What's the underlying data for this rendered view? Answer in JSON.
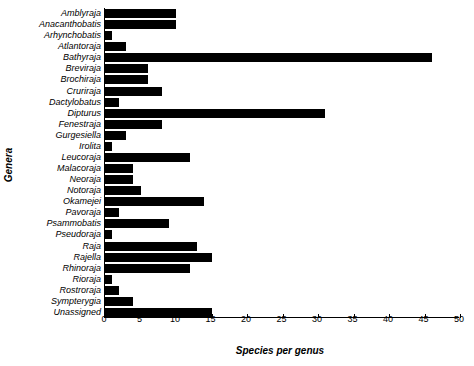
{
  "chart_data": {
    "type": "bar",
    "orientation": "horizontal",
    "title": "",
    "xlabel": "Species per genus",
    "ylabel": "Genera",
    "xlim": [
      0,
      50
    ],
    "xticks": [
      0,
      5,
      10,
      15,
      20,
      25,
      30,
      35,
      40,
      45,
      50
    ],
    "grid": false,
    "legend": null,
    "bar_color": "#000000",
    "categories": [
      "Amblyraja",
      "Anacanthobatis",
      "Arhynchobatis",
      "Atlantoraja",
      "Bathyraja",
      "Breviraja",
      "Brochiraja",
      "Cruriraja",
      "Dactylobatus",
      "Dipturus",
      "Fenestraja",
      "Gurgesiella",
      "Irolita",
      "Leucoraja",
      "Malacoraja",
      "Neoraja",
      "Notoraja",
      "Okamejei",
      "Pavoraja",
      "Psammobatis",
      "Pseudoraja",
      "Raja",
      "Rajella",
      "Rhinoraja",
      "Rioraja",
      "Rostroraja",
      "Sympterygia",
      "Unassigned"
    ],
    "values": [
      10,
      10,
      1,
      3,
      46,
      6,
      6,
      8,
      2,
      31,
      8,
      3,
      1,
      12,
      4,
      4,
      5,
      14,
      2,
      9,
      1,
      13,
      15,
      12,
      1,
      2,
      4,
      15
    ]
  }
}
